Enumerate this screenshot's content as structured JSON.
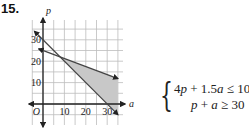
{
  "problem": {
    "number": "15."
  },
  "chart_data": {
    "type": "line",
    "title": "",
    "xlabel": "a",
    "ylabel": "p",
    "origin_label": "O",
    "xlim": [
      -5,
      37
    ],
    "ylim": [
      -10,
      39
    ],
    "grid": true,
    "grid_step": 5,
    "x_ticks": [
      10,
      20,
      30
    ],
    "x_tick_labels": [
      "10",
      "20",
      "30"
    ],
    "y_ticks": [
      10,
      20,
      30
    ],
    "y_tick_labels": [
      "10",
      "20",
      "30"
    ],
    "series": [
      {
        "name": "4p + 1.5a = 100",
        "points": [
          [
            -2,
            25.75
          ],
          [
            35,
            11.875
          ]
        ]
      },
      {
        "name": "p + a = 30",
        "points": [
          [
            -4,
            34
          ],
          [
            35,
            -5
          ]
        ]
      }
    ],
    "shaded_region": {
      "description": "feasible region: 4p + 1.5a <= 100 and p + a >= 30",
      "vertices": [
        [
          8,
          22
        ],
        [
          35,
          11.875
        ],
        [
          35,
          -5
        ]
      ],
      "color": "#c8c8c8"
    },
    "intersection": [
      8,
      22
    ]
  },
  "system": {
    "inequalities": [
      {
        "lhs_coef1": "4",
        "var1": "p",
        "op1": " + 1.5",
        "var2": "a",
        "rel": " ≤ 100"
      },
      {
        "lhs_coef1": "",
        "var1": "p",
        "op1": " + ",
        "var2": "a",
        "rel": " ≥ 30"
      }
    ]
  },
  "colors": {
    "axis": "#222222",
    "grid": "#bdbdbd",
    "line": "#444444",
    "shade": "#c8c8c8"
  }
}
